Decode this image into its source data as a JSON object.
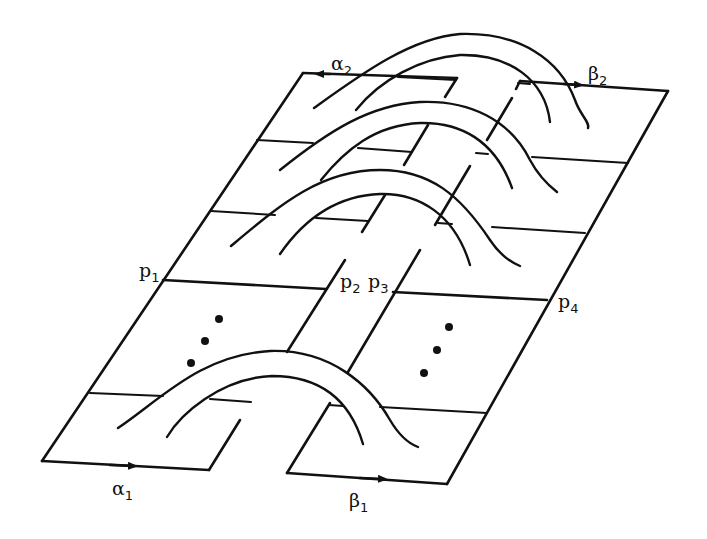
{
  "diagram": {
    "type": "surface-band-diagram",
    "colors": {
      "stroke": "#111111",
      "background": "#ffffff"
    },
    "labels": {
      "alpha1": {
        "base": "α",
        "sub": "1"
      },
      "alpha2": {
        "base": "α",
        "sub": "2"
      },
      "beta1": {
        "base": "β",
        "sub": "1"
      },
      "beta2": {
        "base": "β",
        "sub": "2"
      },
      "p1": {
        "base": "p",
        "sub": "1"
      },
      "p2": {
        "base": "p",
        "sub": "2"
      },
      "p3": {
        "base": "p",
        "sub": "3"
      },
      "p4": {
        "base": "p",
        "sub": "4"
      }
    },
    "ellipsis_left": "⋮",
    "ellipsis_right": "⋮",
    "band_count_visible": 4
  }
}
